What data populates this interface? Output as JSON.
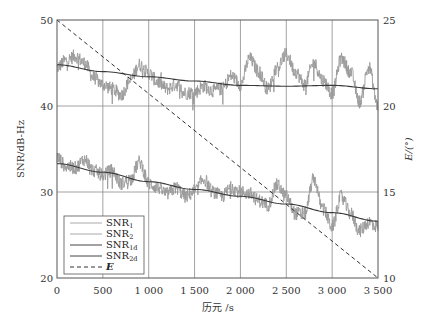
{
  "chart_data": {
    "type": "line",
    "title": "",
    "xlabel": "历元 /s",
    "ylabel": "SNR/dB-Hz",
    "y2label": "E/(°)",
    "xlim": [
      0,
      3500
    ],
    "ylim": [
      20,
      50
    ],
    "y2lim": [
      10,
      25
    ],
    "grid": true,
    "legend_position": "lower left",
    "x_ticks": [
      "0",
      "500",
      "1 000",
      "1 500",
      "2 000",
      "2 500",
      "3 000",
      "3 500"
    ],
    "x_tick_values": [
      0,
      500,
      1000,
      1500,
      2000,
      2500,
      3000,
      3500
    ],
    "y_ticks": [
      "20",
      "30",
      "40",
      "50"
    ],
    "y_tick_values": [
      20,
      30,
      40,
      50
    ],
    "y2_ticks": [
      "10",
      "15",
      "20",
      "25"
    ],
    "y2_tick_values": [
      10,
      15,
      20,
      25
    ],
    "legend": [
      {
        "label": "SNR",
        "sub": "1",
        "style": "solid",
        "color": "#aaaaaa"
      },
      {
        "label": "SNR",
        "sub": "2",
        "style": "solid",
        "color": "#aaaaaa"
      },
      {
        "label": "SNR",
        "sub": "1d",
        "style": "solid",
        "color": "#444444"
      },
      {
        "label": "SNR",
        "sub": "2d",
        "style": "solid",
        "color": "#444444"
      },
      {
        "label": "E",
        "sub": "",
        "style": "dashed",
        "color": "#333333",
        "italic": true
      }
    ],
    "series": [
      {
        "name": "SNR1",
        "axis": "left",
        "style": "noisy",
        "color": "#9a9a9a",
        "x": [
          0,
          100,
          200,
          300,
          400,
          500,
          600,
          700,
          800,
          900,
          1000,
          1100,
          1200,
          1300,
          1400,
          1500,
          1600,
          1700,
          1800,
          1900,
          2000,
          2100,
          2200,
          2300,
          2400,
          2500,
          2600,
          2700,
          2800,
          2900,
          3000,
          3100,
          3200,
          3300,
          3400,
          3500
        ],
        "values": [
          44.5,
          45.3,
          45.8,
          45.0,
          43.3,
          42.5,
          42.0,
          41.3,
          43.0,
          44.8,
          43.8,
          42.8,
          42.0,
          42.5,
          41.5,
          41.6,
          42.3,
          41.8,
          42.0,
          43.5,
          42.5,
          45.5,
          44.0,
          42.0,
          44.5,
          46.0,
          44.0,
          42.5,
          45.0,
          43.0,
          41.5,
          45.5,
          44.0,
          40.5,
          44.5,
          40.0
        ]
      },
      {
        "name": "SNR2",
        "axis": "left",
        "style": "noisy",
        "color": "#9a9a9a",
        "x": [
          0,
          100,
          200,
          300,
          400,
          500,
          600,
          700,
          800,
          900,
          1000,
          1100,
          1200,
          1300,
          1400,
          1500,
          1600,
          1700,
          1800,
          1900,
          2000,
          2100,
          2200,
          2300,
          2400,
          2500,
          2600,
          2700,
          2800,
          2900,
          3000,
          3100,
          3200,
          3300,
          3400,
          3500
        ],
        "values": [
          34.0,
          33.0,
          32.8,
          33.8,
          32.5,
          32.0,
          32.5,
          31.0,
          31.5,
          33.5,
          31.0,
          30.5,
          29.8,
          30.5,
          29.5,
          30.0,
          31.5,
          30.0,
          29.5,
          30.5,
          30.0,
          29.8,
          29.0,
          28.5,
          30.8,
          29.5,
          27.5,
          27.5,
          31.5,
          28.0,
          26.0,
          29.5,
          27.5,
          25.5,
          26.5,
          26.0
        ]
      },
      {
        "name": "SNR1d",
        "axis": "left",
        "style": "smooth",
        "color": "#3a3a3a",
        "x": [
          0,
          500,
          1000,
          1500,
          2000,
          2500,
          3000,
          3500
        ],
        "values": [
          44.8,
          44.0,
          43.4,
          42.9,
          42.4,
          42.3,
          42.4,
          42.0
        ]
      },
      {
        "name": "SNR2d",
        "axis": "left",
        "style": "smooth",
        "color": "#3a3a3a",
        "x": [
          0,
          500,
          1000,
          1500,
          2000,
          2500,
          3000,
          3500
        ],
        "values": [
          33.3,
          32.3,
          31.2,
          30.3,
          29.5,
          28.6,
          27.6,
          26.6
        ]
      },
      {
        "name": "E",
        "axis": "right",
        "style": "dashed",
        "color": "#333333",
        "x": [
          0,
          3500
        ],
        "values": [
          25,
          10
        ]
      }
    ]
  }
}
